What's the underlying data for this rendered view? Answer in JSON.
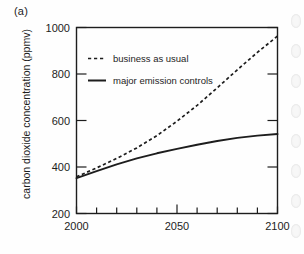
{
  "figure": {
    "panel_label": "(a)",
    "ylabel": "carbon dioxide concentration (ppmv)"
  },
  "axis_labels": {
    "y_1000": "1000",
    "y_800": "800",
    "y_600": "600",
    "y_400": "400",
    "y_200": "200",
    "x_2000": "2000",
    "x_2050": "2050",
    "x_2100": "2100"
  },
  "legend": {
    "entries": [
      {
        "label": "business as usual",
        "style": "dashed",
        "color": "#1d1d1d"
      },
      {
        "label": "major emission controls",
        "style": "solid",
        "color": "#1d1d1d"
      }
    ]
  },
  "chart_data": {
    "type": "line",
    "title": "",
    "subtitle": "",
    "panel": "(a)",
    "xlabel": "",
    "ylabel": "carbon dioxide concentration (ppmv)",
    "xlim": [
      2000,
      2100
    ],
    "ylim": [
      200,
      1000
    ],
    "xticks": [
      2000,
      2010,
      2020,
      2030,
      2040,
      2050,
      2060,
      2070,
      2080,
      2090,
      2100
    ],
    "xticklabels": [
      "2000",
      "",
      "",
      "",
      "",
      "2050",
      "",
      "",
      "",
      "",
      "2100"
    ],
    "yticks": [
      200,
      400,
      600,
      800,
      1000
    ],
    "yticklabels": [
      "200",
      "400",
      "600",
      "800",
      "1000"
    ],
    "grid": false,
    "legend_position": "upper-left-inside",
    "x": [
      2000,
      2010,
      2020,
      2030,
      2040,
      2050,
      2060,
      2070,
      2080,
      2090,
      2100
    ],
    "series": [
      {
        "name": "business as usual",
        "style": "dashed",
        "color": "#1d1d1d",
        "values": [
          358,
          396,
          437,
          482,
          535,
          597,
          665,
          740,
          818,
          893,
          963
        ]
      },
      {
        "name": "major emission controls",
        "style": "solid",
        "color": "#1d1d1d",
        "values": [
          352,
          382,
          411,
          437,
          459,
          478,
          496,
          512,
          525,
          535,
          542
        ]
      }
    ]
  }
}
